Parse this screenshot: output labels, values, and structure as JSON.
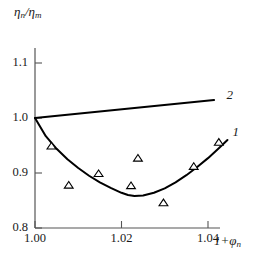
{
  "chart_data": {
    "type": "line",
    "title": "",
    "xlabel": "1+φn",
    "ylabel": "ηn/ηm",
    "xlim": [
      1.0,
      1.0455
    ],
    "ylim": [
      0.8,
      1.115
    ],
    "xticks": [
      1.0,
      1.02,
      1.04
    ],
    "xtick_labels": [
      "1.00",
      "1.02",
      "1.04"
    ],
    "yticks": [
      0.8,
      0.9,
      1.0,
      1.1
    ],
    "ytick_labels": [
      "0.8",
      "0.9",
      "1.0",
      "1.1"
    ],
    "grid": false,
    "legend": "inline-curve-labels",
    "series": [
      {
        "name": "1",
        "label": "1",
        "type": "line",
        "style": "solid",
        "color": "#000000",
        "comment": "U-shaped curve, minimum near 1.021",
        "x": [
          1.0,
          1.0025,
          1.005,
          1.0075,
          1.01,
          1.0125,
          1.015,
          1.0175,
          1.02,
          1.0215,
          1.023,
          1.025,
          1.0275,
          1.03,
          1.0325,
          1.035,
          1.0375,
          1.04,
          1.0425,
          1.0445
        ],
        "y": [
          1.0,
          0.967,
          0.944,
          0.925,
          0.909,
          0.895,
          0.883,
          0.873,
          0.864,
          0.86,
          0.858,
          0.859,
          0.864,
          0.872,
          0.883,
          0.896,
          0.911,
          0.927,
          0.945,
          0.96
        ]
      },
      {
        "name": "2",
        "label": "2",
        "type": "line",
        "style": "solid",
        "color": "#000000",
        "comment": "straight rising line",
        "x": [
          1.0,
          1.0414
        ],
        "y": [
          1.0,
          1.0327
        ]
      },
      {
        "name": "experimental points",
        "label": "",
        "type": "scatter",
        "marker": "triangle-up-open",
        "color": "#000000",
        "x": [
          1.0038,
          1.0078,
          1.0147,
          1.0222,
          1.0238,
          1.0297,
          1.0367,
          1.0425
        ],
        "y": [
          0.949,
          0.878,
          0.899,
          0.877,
          0.927,
          0.846,
          0.912,
          0.956
        ]
      }
    ],
    "curve_labels": [
      {
        "text": "1",
        "x": 1.0452,
        "y": 0.973
      },
      {
        "text": "2",
        "x": 1.0438,
        "y": 1.04
      }
    ]
  },
  "axis": {
    "y_title": "η",
    "y_title_sub1": "n",
    "y_title_mid": "/η",
    "y_title_sub2": "m",
    "x_title": "1+φ",
    "x_title_sub": "n"
  },
  "colors": {
    "axis": "#555555",
    "curve": "#000000",
    "marker": "#333333",
    "background": "#ffffff"
  }
}
